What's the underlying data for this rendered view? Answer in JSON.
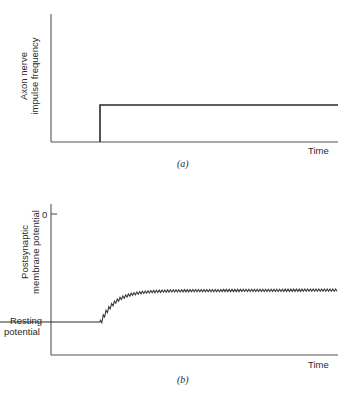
{
  "panel_a": {
    "ylabel_line1": "Axon nerve",
    "ylabel_line2": "impulse frequency",
    "xlabel": "Time",
    "caption": "(a)"
  },
  "panel_b": {
    "ylabel_line1": "Postsynaptic",
    "ylabel_line2": "membrane potential",
    "ytick_zero": "0",
    "resting_line1": "Resting",
    "resting_line2": "potential",
    "xlabel": "Time",
    "caption": "(b)"
  },
  "chart_data": [
    {
      "type": "line",
      "title": "(a)",
      "xlabel": "Time",
      "ylabel": "Axon nerve impulse frequency",
      "description": "Step function: zero until stimulus onset, then constant elevated frequency",
      "x": [
        0,
        0.17,
        0.17,
        1.0
      ],
      "y": [
        0,
        0,
        0.29,
        0.29
      ],
      "grid": false
    },
    {
      "type": "line",
      "title": "(b)",
      "xlabel": "Time",
      "ylabel": "Postsynaptic membrane potential",
      "yticks": [
        "0",
        "Resting potential"
      ],
      "description": "Resting potential until onset, then rises with small sawtooth ripple to a plateau below 0",
      "x": [
        0,
        0.17,
        0.22,
        0.3,
        0.4,
        1.0
      ],
      "y": [
        0,
        0,
        0.15,
        0.25,
        0.29,
        0.3
      ],
      "grid": false
    }
  ]
}
